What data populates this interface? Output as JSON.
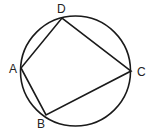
{
  "diagram": {
    "type": "cyclic-quadrilateral",
    "circle": {
      "cx": 75.5,
      "cy": 71,
      "r": 55
    },
    "points": [
      {
        "label": "A",
        "x": 21,
        "y": 68,
        "lx": 9,
        "ly": 73
      },
      {
        "label": "B",
        "x": 46,
        "y": 115,
        "lx": 37,
        "ly": 128
      },
      {
        "label": "C",
        "x": 131,
        "y": 71,
        "lx": 137,
        "ly": 76
      },
      {
        "label": "D",
        "x": 62,
        "y": 18,
        "lx": 57,
        "ly": 13
      }
    ],
    "edges": [
      [
        "A",
        "B"
      ],
      [
        "B",
        "C"
      ],
      [
        "C",
        "D"
      ],
      [
        "D",
        "A"
      ]
    ],
    "stroke": "#1a1a1a"
  }
}
